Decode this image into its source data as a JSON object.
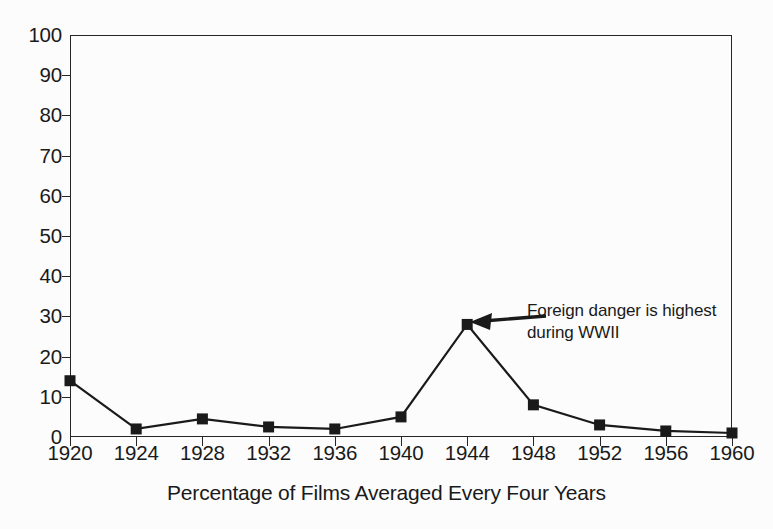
{
  "chart_data": {
    "type": "line",
    "title": "",
    "subtitle": "",
    "xlabel": "Percentage of Films Averaged Every Four Years",
    "ylabel": "",
    "categories": [
      "1920",
      "1924",
      "1928",
      "1932",
      "1936",
      "1940",
      "1944",
      "1948",
      "1952",
      "1956",
      "1960"
    ],
    "values": [
      14,
      2,
      4.5,
      2.5,
      2,
      5,
      28,
      8,
      3,
      1.5,
      1
    ],
    "series": [
      {
        "name": "Percentage of films",
        "values": [
          14,
          2,
          4.5,
          2.5,
          2,
          5,
          28,
          8,
          3,
          1.5,
          1
        ]
      }
    ],
    "ylim": [
      0,
      100
    ],
    "y_ticks": [
      "0",
      "10",
      "20",
      "30",
      "40",
      "50",
      "60",
      "70",
      "80",
      "90",
      "100"
    ],
    "x_ticks": [
      "1920",
      "1924",
      "1928",
      "1932",
      "1936",
      "1940",
      "1944",
      "1948",
      "1952",
      "1956",
      "1960"
    ],
    "grid": false,
    "legend": false,
    "legend_position": "none",
    "marker": "filled-square",
    "line_color": "#1a1a1a",
    "marker_color": "#1a1a1a",
    "background_color": "#fcfcfc",
    "annotations": [
      {
        "text_line_1": "Foreign danger is highest",
        "text_line_2": "during WWII",
        "points_to_category": "1944",
        "points_to_value": 28,
        "arrow_direction": "left"
      }
    ]
  }
}
